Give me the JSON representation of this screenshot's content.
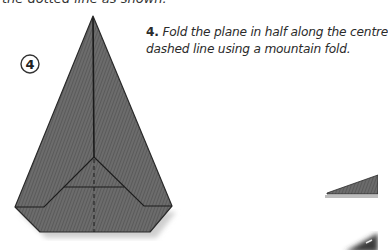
{
  "page": {
    "top_cutoff_text": "the dotted line as shown.",
    "step": {
      "badge": "4",
      "number": "4.",
      "line1": " Fold the plane in half along the centre",
      "line2": "dashed line using a mountain fold."
    },
    "colors": {
      "paper_fill": "#686868",
      "fold_line": "#1c1c1c",
      "shadow": "#c8c8c8",
      "text": "#2b2b2b"
    }
  }
}
